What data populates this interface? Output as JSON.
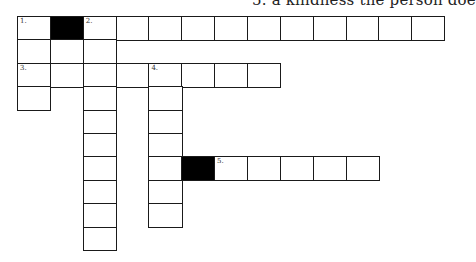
{
  "header": {
    "clue_fragment": "5. a kindness the person doe"
  },
  "grid": {
    "origin_x": 17,
    "origin_y": 16,
    "cell_width": 32.85,
    "cell_height": 23.4,
    "cells": [
      {
        "r": 0,
        "c": 0,
        "num": "1."
      },
      {
        "r": 0,
        "c": 1,
        "black": true
      },
      {
        "r": 0,
        "c": 2,
        "num": "2."
      },
      {
        "r": 0,
        "c": 3
      },
      {
        "r": 0,
        "c": 4
      },
      {
        "r": 0,
        "c": 5
      },
      {
        "r": 0,
        "c": 6
      },
      {
        "r": 0,
        "c": 7
      },
      {
        "r": 0,
        "c": 8
      },
      {
        "r": 0,
        "c": 9
      },
      {
        "r": 0,
        "c": 10
      },
      {
        "r": 0,
        "c": 11
      },
      {
        "r": 0,
        "c": 12
      },
      {
        "r": 1,
        "c": 0
      },
      {
        "r": 1,
        "c": 1
      },
      {
        "r": 1,
        "c": 2
      },
      {
        "r": 2,
        "c": 0,
        "num": "3."
      },
      {
        "r": 2,
        "c": 1
      },
      {
        "r": 2,
        "c": 2
      },
      {
        "r": 2,
        "c": 3
      },
      {
        "r": 2,
        "c": 4,
        "num": "4."
      },
      {
        "r": 2,
        "c": 5
      },
      {
        "r": 2,
        "c": 6
      },
      {
        "r": 2,
        "c": 7
      },
      {
        "r": 3,
        "c": 0
      },
      {
        "r": 3,
        "c": 2
      },
      {
        "r": 3,
        "c": 4
      },
      {
        "r": 4,
        "c": 2
      },
      {
        "r": 4,
        "c": 4
      },
      {
        "r": 5,
        "c": 2
      },
      {
        "r": 5,
        "c": 4
      },
      {
        "r": 6,
        "c": 2
      },
      {
        "r": 6,
        "c": 4
      },
      {
        "r": 6,
        "c": 5,
        "black": true
      },
      {
        "r": 6,
        "c": 6,
        "num": "5."
      },
      {
        "r": 6,
        "c": 7
      },
      {
        "r": 6,
        "c": 8
      },
      {
        "r": 6,
        "c": 9
      },
      {
        "r": 6,
        "c": 10
      },
      {
        "r": 7,
        "c": 2
      },
      {
        "r": 7,
        "c": 4
      },
      {
        "r": 8,
        "c": 2
      },
      {
        "r": 8,
        "c": 4
      },
      {
        "r": 9,
        "c": 2
      }
    ]
  }
}
